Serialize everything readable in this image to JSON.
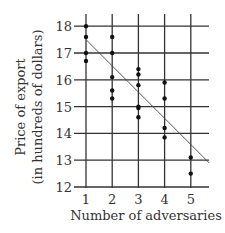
{
  "chart_data": {
    "type": "scatter",
    "title": "",
    "xlabel": "Number of adversaries",
    "ylabel_line1": "Price of export",
    "ylabel_line2": "(in hundreds of dollars)",
    "x_ticks": [
      1,
      2,
      3,
      4,
      5
    ],
    "y_ticks": [
      12,
      13,
      14,
      15,
      16,
      17,
      18
    ],
    "xlim": [
      0.85,
      5.7
    ],
    "ylim": [
      12,
      18.4
    ],
    "grid": true,
    "points": [
      {
        "x": 1,
        "y": 18.0
      },
      {
        "x": 1,
        "y": 17.6
      },
      {
        "x": 1,
        "y": 17.0
      },
      {
        "x": 1,
        "y": 16.7
      },
      {
        "x": 2,
        "y": 17.6
      },
      {
        "x": 2,
        "y": 17.0
      },
      {
        "x": 2,
        "y": 16.1
      },
      {
        "x": 2,
        "y": 15.6
      },
      {
        "x": 2,
        "y": 15.3
      },
      {
        "x": 3,
        "y": 16.4
      },
      {
        "x": 3,
        "y": 16.2
      },
      {
        "x": 3,
        "y": 15.8
      },
      {
        "x": 3,
        "y": 15.0
      },
      {
        "x": 3,
        "y": 14.95
      },
      {
        "x": 3,
        "y": 14.6
      },
      {
        "x": 4,
        "y": 15.9
      },
      {
        "x": 4,
        "y": 15.3
      },
      {
        "x": 4,
        "y": 14.2
      },
      {
        "x": 4,
        "y": 13.85
      },
      {
        "x": 5,
        "y": 13.1
      },
      {
        "x": 5,
        "y": 12.5
      }
    ],
    "line_of_best_fit": {
      "x1": 1,
      "y1": 17.5,
      "x2": 5.7,
      "y2": 12.9
    }
  }
}
